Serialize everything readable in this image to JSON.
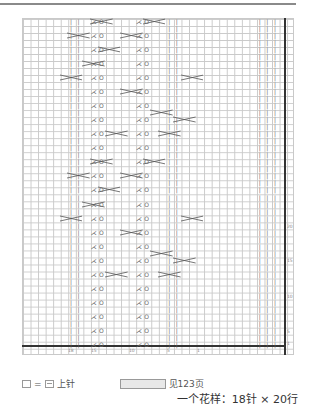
{
  "chart": {
    "columns": 36,
    "rows": 48,
    "row_labels": [
      "20",
      "15",
      "10",
      "5",
      "1"
    ],
    "col_labels": [
      "18",
      "15",
      "10",
      "5",
      "1"
    ]
  },
  "symbols": {
    "knit": "|",
    "yarn_over": "O",
    "k2tog": "⋏",
    "ssk": "⋌"
  },
  "legend": {
    "equals": "=",
    "purl_label": "上针",
    "see_page": "见123页"
  },
  "footer": {
    "pattern_repeat": "一个花样：18针 × 20行"
  }
}
